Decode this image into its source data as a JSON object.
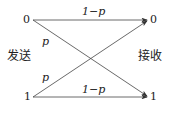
{
  "diagram": {
    "type": "binary-symmetric-channel",
    "sender_label": "发送",
    "receiver_label": "接收",
    "inputs": [
      "0",
      "1"
    ],
    "outputs": [
      "0",
      "1"
    ],
    "edges": [
      {
        "from": "0",
        "to": "0",
        "label": "1−p"
      },
      {
        "from": "0",
        "to": "1",
        "label": "p"
      },
      {
        "from": "1",
        "to": "0",
        "label": "p"
      },
      {
        "from": "1",
        "to": "1",
        "label": "1−p"
      }
    ]
  }
}
